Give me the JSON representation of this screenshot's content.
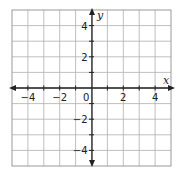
{
  "chart_data": {
    "type": "scatter",
    "title": "",
    "xlabel": "x",
    "ylabel": "y",
    "xlim": [
      -5,
      5
    ],
    "ylim": [
      -5,
      5
    ],
    "grid": true,
    "grid_step": 1,
    "x_ticks": [
      -4,
      -2,
      2,
      4
    ],
    "y_ticks": [
      4,
      2,
      -2,
      -4
    ],
    "x_tick_labels": [
      "−4",
      "−2",
      "2",
      "4"
    ],
    "y_tick_labels": [
      "4",
      "2",
      "−2",
      "−4"
    ],
    "origin_label": "0",
    "series": [],
    "colors": {
      "grid": "#b0b0b0",
      "axis": "#222222",
      "border": "#999999"
    }
  }
}
